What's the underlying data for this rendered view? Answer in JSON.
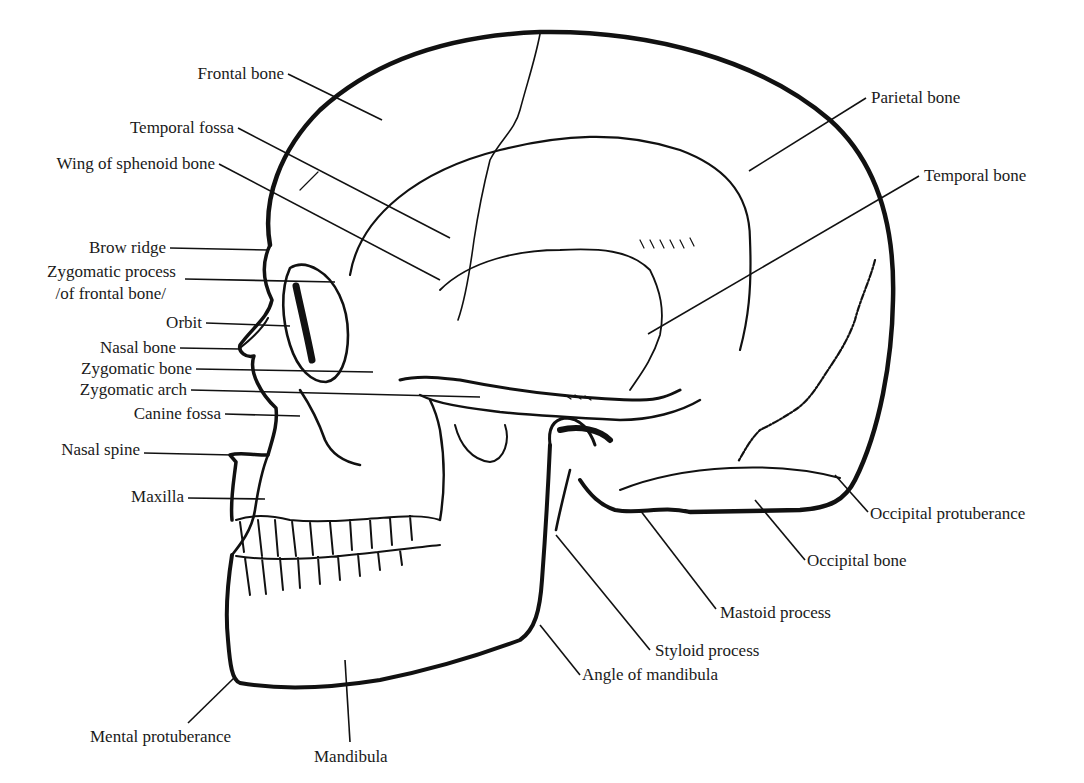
{
  "diagram": {
    "colors": {
      "ink": "#111111",
      "background": "#ffffff",
      "label": "#1a1a1a"
    },
    "labels": {
      "frontal_bone": "Frontal bone",
      "temporal_fossa": "Temporal fossa",
      "wing_sphenoid": "Wing of sphenoid bone",
      "brow_ridge": "Brow ridge",
      "zygomatic_process_1": "Zygomatic process",
      "zygomatic_process_2": "/of frontal bone/",
      "orbit": "Orbit",
      "nasal_bone": "Nasal bone",
      "zygomatic_bone": "Zygomatic bone",
      "zygomatic_arch": "Zygomatic arch",
      "canine_fossa": "Canine fossa",
      "nasal_spine": "Nasal spine",
      "maxilla": "Maxilla",
      "mental_protuberance": "Mental protuberance",
      "mandibula": "Mandibula",
      "parietal_bone": "Parietal bone",
      "temporal_bone": "Temporal bone",
      "occipital_protuberance": "Occipital protuberance",
      "occipital_bone": "Occipital bone",
      "mastoid_process": "Mastoid process",
      "styloid_process": "Styloid process",
      "angle_of_mandibula": "Angle of mandibula"
    }
  }
}
